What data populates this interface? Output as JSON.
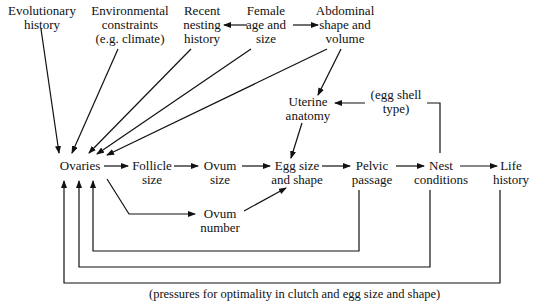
{
  "nodes": {
    "evolutionary_history": {
      "l1": "Evolutionary",
      "l2": "history"
    },
    "environmental_constraints": {
      "l1": "Environmental",
      "l2": "constraints",
      "l3": "(e.g. climate)"
    },
    "recent_nesting_history": {
      "l1": "Recent",
      "l2": "nesting",
      "l3": "history"
    },
    "female_age_size": {
      "l1": "Female",
      "l2": "age and",
      "l3": "size"
    },
    "abdominal_shape_volume": {
      "l1": "Abdominal",
      "l2": "shape and",
      "l3": "volume"
    },
    "uterine_anatomy": {
      "l1": "Uterine",
      "l2": "anatomy"
    },
    "egg_shell_type": {
      "l1": "(egg shell",
      "l2": "type)"
    },
    "ovaries": {
      "l1": "Ovaries"
    },
    "follicle_size": {
      "l1": "Follicle",
      "l2": "size"
    },
    "ovum_size": {
      "l1": "Ovum",
      "l2": "size"
    },
    "ovum_number": {
      "l1": "Ovum",
      "l2": "number"
    },
    "egg_size_shape": {
      "l1": "Egg size",
      "l2": "and shape"
    },
    "pelvic_passage": {
      "l1": "Pelvic",
      "l2": "passage"
    },
    "nest_conditions": {
      "l1": "Nest",
      "l2": "conditions"
    },
    "life_history": {
      "l1": "Life",
      "l2": "history"
    }
  },
  "caption": "(pressures for optimality in clutch and egg size and shape)"
}
